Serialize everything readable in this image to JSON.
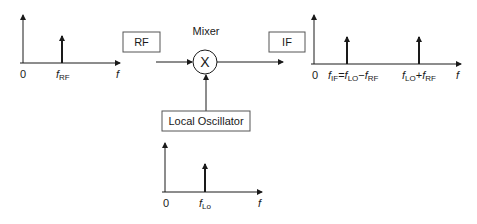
{
  "diagram": {
    "colors": {
      "stroke": "#1a1a1a",
      "background": "#ffffff",
      "box_border": "#555555"
    },
    "blocks": {
      "rf": {
        "label": "RF"
      },
      "if": {
        "label": "IF"
      },
      "mixer": {
        "label": "Mixer",
        "symbol": "X"
      },
      "lo": {
        "label": "Local Oscillator"
      }
    },
    "spectra": {
      "input": {
        "origin_label": "0",
        "axis_label": "f",
        "spikes": [
          {
            "main": "f",
            "sub": "RF"
          }
        ]
      },
      "output": {
        "origin_label": "0",
        "axis_label": "f",
        "spikes": [
          {
            "parts": [
              {
                "main": "f",
                "sub": "IF"
              },
              {
                "main": "=",
                "sub": ""
              },
              {
                "main": "f",
                "sub": "LO"
              },
              {
                "main": "−",
                "sub": ""
              },
              {
                "main": "f",
                "sub": "RF"
              }
            ]
          },
          {
            "parts": [
              {
                "main": "f",
                "sub": "LO"
              },
              {
                "main": "+",
                "sub": ""
              },
              {
                "main": "f",
                "sub": "RF"
              }
            ]
          }
        ]
      },
      "lo": {
        "origin_label": "0",
        "axis_label": "f",
        "spikes": [
          {
            "main": "f",
            "sub": "Lo"
          }
        ]
      }
    }
  }
}
